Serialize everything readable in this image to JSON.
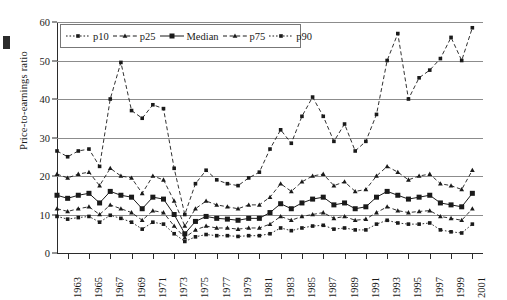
{
  "chart_data": {
    "type": "line",
    "title": "",
    "xlabel": "",
    "ylabel": "Price-to-earnings ratio",
    "ylim": [
      0,
      60
    ],
    "yticks": [
      0,
      10,
      20,
      30,
      40,
      50,
      60
    ],
    "xlim": [
      1962,
      2002
    ],
    "xtick_labels": [
      "1963",
      "1965",
      "1967",
      "1969",
      "1971",
      "1973",
      "1975",
      "1977",
      "1979",
      "1981",
      "1983",
      "1985",
      "1987",
      "1989",
      "1991",
      "1993",
      "1995",
      "1997",
      "1999",
      "2001"
    ],
    "grid": "horizontal",
    "legend_position": "top-left",
    "x": [
      1962,
      1963,
      1964,
      1965,
      1966,
      1967,
      1968,
      1969,
      1970,
      1971,
      1972,
      1973,
      1974,
      1975,
      1976,
      1977,
      1978,
      1979,
      1980,
      1981,
      1982,
      1983,
      1984,
      1985,
      1986,
      1987,
      1988,
      1989,
      1990,
      1991,
      1992,
      1993,
      1994,
      1995,
      1996,
      1997,
      1998,
      1999,
      2000,
      2001
    ],
    "series": [
      {
        "name": "p10",
        "marker": "small-square",
        "line": "dotted",
        "values": [
          9.5,
          8.8,
          9.2,
          9.5,
          8.0,
          9.8,
          9.0,
          8.0,
          6.2,
          8.0,
          7.5,
          5.0,
          3.0,
          4.2,
          4.8,
          4.5,
          4.5,
          4.3,
          4.5,
          4.5,
          5.0,
          6.5,
          5.8,
          6.5,
          7.0,
          7.2,
          6.2,
          6.5,
          6.0,
          6.0,
          7.5,
          8.5,
          7.8,
          7.5,
          7.5,
          7.8,
          6.0,
          5.5,
          5.2,
          7.5
        ]
      },
      {
        "name": "p25",
        "marker": "triangle",
        "line": "dashed",
        "values": [
          11.5,
          10.8,
          11.5,
          12.0,
          10.0,
          12.5,
          11.5,
          10.5,
          8.5,
          11.0,
          10.5,
          7.0,
          4.0,
          6.0,
          7.0,
          6.5,
          6.5,
          6.2,
          6.5,
          6.5,
          7.5,
          9.5,
          8.5,
          9.5,
          10.0,
          10.5,
          9.0,
          9.5,
          8.5,
          8.8,
          10.5,
          12.0,
          11.0,
          10.5,
          10.8,
          11.0,
          9.5,
          9.0,
          8.5,
          11.5
        ]
      },
      {
        "name": "Median",
        "marker": "square",
        "line": "solid",
        "values": [
          15.0,
          14.2,
          15.0,
          15.5,
          13.0,
          16.0,
          15.0,
          14.5,
          11.5,
          14.5,
          14.0,
          10.0,
          5.0,
          8.2,
          9.5,
          9.0,
          8.8,
          8.5,
          9.0,
          9.0,
          10.5,
          12.8,
          11.5,
          13.0,
          14.0,
          14.5,
          12.5,
          13.0,
          11.5,
          12.0,
          14.5,
          16.0,
          15.0,
          14.0,
          14.5,
          15.0,
          13.0,
          12.5,
          12.0,
          15.5
        ]
      },
      {
        "name": "p75",
        "marker": "triangle",
        "line": "dashed",
        "values": [
          20.5,
          19.5,
          20.5,
          21.0,
          17.5,
          22.0,
          20.0,
          19.5,
          15.5,
          20.0,
          19.0,
          13.5,
          7.0,
          11.5,
          13.5,
          12.5,
          12.0,
          11.5,
          12.5,
          12.5,
          14.5,
          18.0,
          16.0,
          18.5,
          20.0,
          20.5,
          17.5,
          18.5,
          16.0,
          16.5,
          20.0,
          22.5,
          21.0,
          19.0,
          20.0,
          20.5,
          18.0,
          17.5,
          16.5,
          21.5
        ]
      },
      {
        "name": "p90",
        "marker": "small-square",
        "line": "dashed",
        "values": [
          26.5,
          25.0,
          26.5,
          27.0,
          22.5,
          40.0,
          49.5,
          37.0,
          35.0,
          38.5,
          37.5,
          22.0,
          10.0,
          18.0,
          21.5,
          19.0,
          18.0,
          17.5,
          19.5,
          21.0,
          27.0,
          32.0,
          28.5,
          35.5,
          40.5,
          35.5,
          29.0,
          33.5,
          26.5,
          29.0,
          36.0,
          50.0,
          57.0,
          40.0,
          45.5,
          47.5,
          50.5,
          56.0,
          50.0,
          58.5
        ]
      }
    ]
  },
  "legend": {
    "items": [
      {
        "label": "p10"
      },
      {
        "label": "p25"
      },
      {
        "label": "Median"
      },
      {
        "label": "p75"
      },
      {
        "label": "p90"
      }
    ]
  },
  "colors": {
    "ink": "#1a1a1a",
    "grid": "#8c8c8c",
    "background": "#ffffff"
  }
}
